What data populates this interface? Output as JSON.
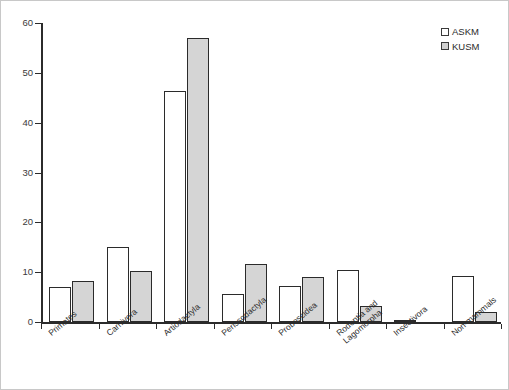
{
  "chart_data": {
    "type": "bar",
    "title": "",
    "xlabel": "",
    "ylabel": "",
    "ylim": [
      0,
      60
    ],
    "yticks": [
      0,
      10,
      20,
      30,
      40,
      50,
      60
    ],
    "grid": false,
    "legend_position": "top-right",
    "categories": [
      "Primates",
      "Carnivora",
      "Artiodactyla",
      "Perissodactyla",
      "Proboscidea",
      "Rodentia and\nLagomorpha",
      "Insectivora",
      "Non-mammals"
    ],
    "series": [
      {
        "name": "ASKM",
        "color": "#ffffff",
        "values": [
          7.0,
          15.0,
          46.3,
          5.6,
          7.3,
          10.4,
          0.3,
          9.3
        ]
      },
      {
        "name": "KUSM",
        "color": "#d5d5d5",
        "values": [
          8.2,
          10.3,
          57.0,
          11.6,
          9.1,
          3.3,
          0.0,
          2.0
        ]
      }
    ]
  },
  "legend": {
    "items": [
      {
        "label": "ASKM",
        "swatch": "white-square"
      },
      {
        "label": "KUSM",
        "swatch": "gray-square"
      }
    ]
  }
}
